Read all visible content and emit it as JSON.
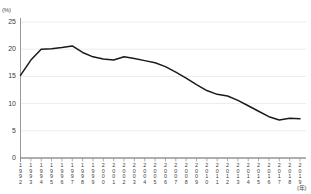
{
  "chart_data": {
    "type": "line",
    "title": "",
    "xlabel": "(年)",
    "ylabel": "(%)",
    "ylim": [
      0,
      25
    ],
    "ytick_labels": [
      "0",
      "5",
      "10",
      "15",
      "20",
      "25"
    ],
    "ytick_values": [
      0,
      5,
      10,
      15,
      20,
      25
    ],
    "grid": true,
    "legend": "none",
    "categories": [
      "1992",
      "1993",
      "1994",
      "1995",
      "1996",
      "1997",
      "1998",
      "1999",
      "2000",
      "2001",
      "2002",
      "2003",
      "2004",
      "2005",
      "2006",
      "2007",
      "2008",
      "2009",
      "2010",
      "2011",
      "2012",
      "2013",
      "2014",
      "2015",
      "2016",
      "2017",
      "2018",
      "2019"
    ],
    "values": [
      15.2,
      18.0,
      20.0,
      20.1,
      20.3,
      20.6,
      19.4,
      18.6,
      18.2,
      18.0,
      18.6,
      18.3,
      17.9,
      17.5,
      16.8,
      15.8,
      14.7,
      13.5,
      12.4,
      11.7,
      11.4,
      10.6,
      9.6,
      8.6,
      7.6,
      7.0,
      7.3,
      7.2
    ],
    "line_color": "#1a1a1a",
    "grid_color": "#e3e3e3",
    "axis_color": "#8c8c8c"
  }
}
